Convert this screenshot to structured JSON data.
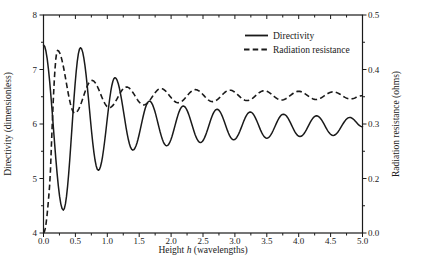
{
  "colors": {
    "line": "#1a1a1a",
    "text": "#1a1a1a",
    "background": "#ffffff"
  },
  "labels": {
    "xlabel_parts": [
      "Height ",
      "h",
      " (wavelengths)"
    ],
    "ylabel_left": "Directivity (dimensionless)",
    "ylabel_right": "Radiation resistance (ohms)",
    "legend_directivity": "Directivity",
    "legend_radiation": "Radiation resistance"
  },
  "chart_data": {
    "type": "line",
    "title": "",
    "xlabel": "Height h (wavelengths)",
    "ylabel_left": "Directivity (dimensionless)",
    "ylabel_right": "Radiation resistance (ohms)",
    "xlim": [
      0.0,
      5.0
    ],
    "ylim_left": [
      4,
      8
    ],
    "grid": false,
    "legend_position": "upper center-right, no box",
    "x_major_ticks": [
      "0.0",
      "0.5",
      "1.0",
      "1.5",
      "2.0",
      "2.5",
      "3.0",
      "3.5",
      "4.0",
      "4.5",
      "5.0"
    ],
    "x_minor_step": 0.25,
    "left_major_ticks": [
      "4",
      "5",
      "6",
      "7",
      "8"
    ],
    "left_minor_ticks": [
      4.5,
      5.5,
      6.5,
      7.5
    ],
    "right_major_ticks": [
      {
        "value": 0.0,
        "label": "0.0"
      },
      {
        "value": 0.2,
        "label": "0.2"
      },
      {
        "value": 0.3,
        "label": "0.3"
      },
      {
        "value": 0.4,
        "label": "0.4"
      },
      {
        "value": 0.5,
        "label": "0.5"
      }
    ],
    "right_minor_ticks": [
      0.1,
      0.25,
      0.35,
      0.45
    ],
    "right_axis_note": "interval 0.0-0.2 is compressed into a single division equal to the 0.1 divisions above it",
    "series": [
      {
        "name": "Directivity",
        "axis": "left",
        "style": "solid",
        "points_are": "successive extrema (h, directivity)",
        "points": [
          [
            0.0,
            7.45
          ],
          [
            0.31,
            4.42
          ],
          [
            0.58,
            7.4
          ],
          [
            0.86,
            5.15
          ],
          [
            1.12,
            6.85
          ],
          [
            1.4,
            5.52
          ],
          [
            1.66,
            6.42
          ],
          [
            1.93,
            5.6
          ],
          [
            2.19,
            6.33
          ],
          [
            2.46,
            5.66
          ],
          [
            2.72,
            6.27
          ],
          [
            2.98,
            5.71
          ],
          [
            3.24,
            6.22
          ],
          [
            3.5,
            5.74
          ],
          [
            3.76,
            6.18
          ],
          [
            4.02,
            5.77
          ],
          [
            4.28,
            6.15
          ],
          [
            4.54,
            5.79
          ],
          [
            4.8,
            6.12
          ],
          [
            5.0,
            5.95
          ]
        ]
      },
      {
        "name": "Radiation resistance",
        "axis": "right",
        "style": "dashed",
        "points_are": "successive extrema (h, ohms)",
        "points": [
          [
            0.0,
            0.0
          ],
          [
            0.22,
            0.435
          ],
          [
            0.49,
            0.32
          ],
          [
            0.76,
            0.38
          ],
          [
            1.03,
            0.33
          ],
          [
            1.3,
            0.368
          ],
          [
            1.57,
            0.335
          ],
          [
            1.84,
            0.365
          ],
          [
            2.11,
            0.339
          ],
          [
            2.38,
            0.363
          ],
          [
            2.65,
            0.341
          ],
          [
            2.92,
            0.362
          ],
          [
            3.19,
            0.343
          ],
          [
            3.46,
            0.361
          ],
          [
            3.73,
            0.344
          ],
          [
            4.0,
            0.36
          ],
          [
            4.27,
            0.345
          ],
          [
            4.54,
            0.359
          ],
          [
            4.81,
            0.346
          ],
          [
            5.0,
            0.352
          ]
        ]
      }
    ]
  }
}
